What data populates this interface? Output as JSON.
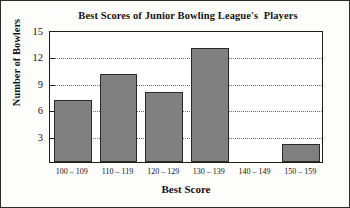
{
  "chart_data": {
    "type": "bar",
    "title": "Best Scores of Junior Bowling League's  Players",
    "xlabel": "Best Score",
    "ylabel": "Number of Bowlers",
    "categories": [
      "100 – 109",
      "110 – 119",
      "120 – 129",
      "130 – 139",
      "140 – 149",
      "150 – 159"
    ],
    "values": [
      7,
      10,
      8,
      13,
      0,
      2
    ],
    "ylim": [
      0,
      15
    ],
    "yticks": [
      3,
      6,
      9,
      12,
      15
    ],
    "ytick_labels": [
      "3",
      "6",
      "9",
      "12",
      "15"
    ],
    "grid": true,
    "grid_axis": "y",
    "grid_style": "dotted",
    "legend": false,
    "bar_color": "#808080",
    "bar_edge_color": "#2a2a2a",
    "frame_color": "#1d1d1d",
    "text_color": "#141414"
  }
}
